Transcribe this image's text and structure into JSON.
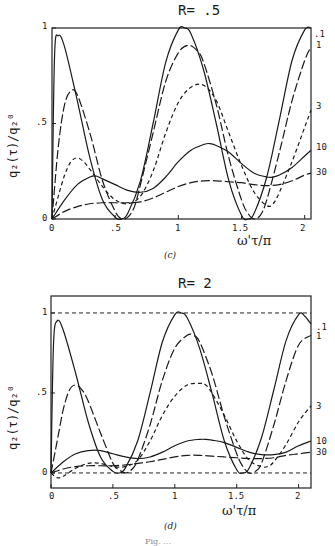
{
  "figure_caption_partial": "Fig. ...",
  "chart_data": [
    {
      "type": "line",
      "panel_label": "(c)",
      "title": "R= .5",
      "xlabel": "ω'τ/π",
      "ylabel": "q₂(τ)/q₂⁰",
      "xlim": [
        0,
        2.05
      ],
      "ylim": [
        0,
        1
      ],
      "xticks": [
        "0",
        ".5",
        "1",
        "1.5",
        "2"
      ],
      "yticks": [
        "0",
        ".5",
        "1"
      ],
      "grid": false,
      "legend_position": "right-edge labels",
      "reference_lines": [],
      "series": [
        {
          "name": ".1",
          "style": "solid",
          "x": [
            0,
            0.02,
            0.05,
            0.1,
            0.2,
            0.3,
            0.4,
            0.5,
            0.55,
            0.6,
            0.7,
            0.8,
            0.9,
            1.0,
            1.05,
            1.1,
            1.2,
            1.3,
            1.4,
            1.5,
            1.55,
            1.6,
            1.7,
            1.8,
            1.9,
            2.0,
            2.05
          ],
          "y": [
            0,
            0.85,
            0.96,
            0.9,
            0.62,
            0.32,
            0.1,
            0.01,
            0.0,
            0.03,
            0.2,
            0.5,
            0.82,
            0.99,
            1.0,
            0.97,
            0.78,
            0.5,
            0.2,
            0.02,
            0.0,
            0.03,
            0.22,
            0.52,
            0.83,
            0.99,
            1.0
          ]
        },
        {
          "name": "1",
          "style": "long-dash",
          "x": [
            0,
            0.05,
            0.1,
            0.15,
            0.2,
            0.3,
            0.4,
            0.5,
            0.55,
            0.6,
            0.65,
            0.7,
            0.8,
            0.9,
            1.0,
            1.08,
            1.15,
            1.2,
            1.3,
            1.4,
            1.5,
            1.55,
            1.6,
            1.65,
            1.7,
            1.8,
            1.9,
            2.0,
            2.05
          ],
          "y": [
            0,
            0.38,
            0.6,
            0.67,
            0.65,
            0.45,
            0.2,
            0.04,
            0.0,
            0.01,
            0.06,
            0.18,
            0.45,
            0.72,
            0.87,
            0.91,
            0.88,
            0.82,
            0.6,
            0.32,
            0.1,
            0.03,
            0.0,
            0.02,
            0.1,
            0.35,
            0.62,
            0.83,
            0.9
          ]
        },
        {
          "name": "3",
          "style": "short-dash",
          "x": [
            0,
            0.05,
            0.1,
            0.15,
            0.2,
            0.25,
            0.3,
            0.4,
            0.5,
            0.6,
            0.7,
            0.8,
            0.9,
            1.0,
            1.1,
            1.2,
            1.3,
            1.4,
            1.5,
            1.6,
            1.7,
            1.75,
            1.8,
            1.9,
            2.0,
            2.05
          ],
          "y": [
            0,
            0.12,
            0.23,
            0.3,
            0.32,
            0.3,
            0.26,
            0.17,
            0.1,
            0.08,
            0.12,
            0.25,
            0.45,
            0.61,
            0.69,
            0.7,
            0.62,
            0.45,
            0.28,
            0.14,
            0.07,
            0.08,
            0.14,
            0.3,
            0.48,
            0.57
          ]
        },
        {
          "name": "10",
          "style": "solid",
          "x": [
            0,
            0.1,
            0.2,
            0.3,
            0.35,
            0.4,
            0.5,
            0.6,
            0.7,
            0.8,
            0.9,
            1.0,
            1.1,
            1.2,
            1.25,
            1.3,
            1.4,
            1.5,
            1.6,
            1.7,
            1.75,
            1.8,
            1.9,
            2.0,
            2.05
          ],
          "y": [
            0,
            0.1,
            0.18,
            0.22,
            0.225,
            0.21,
            0.18,
            0.15,
            0.14,
            0.16,
            0.22,
            0.3,
            0.36,
            0.39,
            0.395,
            0.385,
            0.35,
            0.29,
            0.24,
            0.22,
            0.22,
            0.23,
            0.27,
            0.33,
            0.36
          ]
        },
        {
          "name": "30",
          "style": "long-dash",
          "x": [
            0,
            0.1,
            0.2,
            0.3,
            0.4,
            0.5,
            0.6,
            0.7,
            0.8,
            0.9,
            1.0,
            1.1,
            1.2,
            1.3,
            1.4,
            1.5,
            1.6,
            1.7,
            1.8,
            1.9,
            2.0,
            2.05
          ],
          "y": [
            0,
            0.04,
            0.065,
            0.08,
            0.085,
            0.085,
            0.085,
            0.09,
            0.11,
            0.14,
            0.17,
            0.19,
            0.2,
            0.2,
            0.195,
            0.19,
            0.18,
            0.175,
            0.18,
            0.2,
            0.23,
            0.24
          ]
        }
      ]
    },
    {
      "type": "line",
      "panel_label": "(d)",
      "title": "R= 2",
      "xlabel": "ω'τ/π",
      "ylabel": "q₂(τ)/q₂⁰",
      "xlim": [
        0,
        2.1
      ],
      "ylim": [
        -0.094,
        1.106
      ],
      "xticks": [
        "0",
        ".5",
        "1",
        "1.5",
        "2"
      ],
      "yticks": [
        "0",
        ".5",
        "1"
      ],
      "grid": false,
      "legend_position": "right-edge labels",
      "reference_lines": [
        {
          "y": 1,
          "style": "short-dash"
        },
        {
          "y": 0,
          "style": "short-dash"
        }
      ],
      "series": [
        {
          "name": ".1",
          "style": "solid",
          "x": [
            0,
            0.02,
            0.05,
            0.1,
            0.2,
            0.3,
            0.4,
            0.5,
            0.55,
            0.6,
            0.7,
            0.8,
            0.9,
            1.0,
            1.05,
            1.1,
            1.2,
            1.3,
            1.4,
            1.5,
            1.55,
            1.6,
            1.7,
            1.8,
            1.9,
            2.0,
            2.05,
            2.1
          ],
          "y": [
            0,
            0.8,
            0.95,
            0.89,
            0.62,
            0.32,
            0.1,
            0.01,
            0.0,
            0.03,
            0.2,
            0.5,
            0.82,
            0.99,
            1.0,
            0.97,
            0.78,
            0.5,
            0.2,
            0.02,
            0.0,
            0.03,
            0.22,
            0.52,
            0.83,
            0.99,
            0.98,
            0.93
          ]
        },
        {
          "name": "1",
          "style": "long-dash",
          "x": [
            0,
            0.05,
            0.1,
            0.15,
            0.2,
            0.25,
            0.3,
            0.4,
            0.5,
            0.55,
            0.6,
            0.65,
            0.7,
            0.8,
            0.9,
            1.0,
            1.1,
            1.15,
            1.2,
            1.3,
            1.4,
            1.5,
            1.55,
            1.6,
            1.65,
            1.7,
            1.8,
            1.9,
            2.0,
            2.1
          ],
          "y": [
            0,
            0.2,
            0.4,
            0.52,
            0.55,
            0.52,
            0.45,
            0.25,
            0.06,
            0.02,
            0.0,
            0.02,
            0.08,
            0.3,
            0.58,
            0.78,
            0.86,
            0.86,
            0.82,
            0.62,
            0.35,
            0.12,
            0.04,
            0.0,
            0.01,
            0.06,
            0.3,
            0.58,
            0.8,
            0.86
          ]
        },
        {
          "name": "3",
          "style": "short-dash",
          "x": [
            0,
            0.05,
            0.1,
            0.2,
            0.3,
            0.4,
            0.5,
            0.6,
            0.7,
            0.8,
            0.9,
            1.0,
            1.1,
            1.2,
            1.25,
            1.3,
            1.4,
            1.5,
            1.6,
            1.7,
            1.75,
            1.8,
            1.9,
            2.0,
            2.1
          ],
          "y": [
            0,
            -0.03,
            -0.02,
            0.03,
            0.06,
            0.06,
            0.04,
            0.04,
            0.08,
            0.2,
            0.36,
            0.48,
            0.55,
            0.56,
            0.55,
            0.5,
            0.36,
            0.2,
            0.08,
            0.04,
            0.04,
            0.07,
            0.18,
            0.32,
            0.42
          ]
        },
        {
          "name": "10",
          "style": "solid",
          "x": [
            0,
            0.1,
            0.2,
            0.3,
            0.4,
            0.5,
            0.6,
            0.7,
            0.8,
            0.9,
            1.0,
            1.1,
            1.2,
            1.25,
            1.3,
            1.4,
            1.5,
            1.6,
            1.7,
            1.8,
            1.9,
            2.0,
            2.1
          ],
          "y": [
            0,
            0.07,
            0.12,
            0.14,
            0.14,
            0.12,
            0.1,
            0.09,
            0.1,
            0.13,
            0.17,
            0.2,
            0.21,
            0.21,
            0.205,
            0.19,
            0.16,
            0.13,
            0.115,
            0.115,
            0.13,
            0.17,
            0.2
          ]
        },
        {
          "name": "30",
          "style": "long-dash",
          "x": [
            0,
            0.1,
            0.2,
            0.3,
            0.4,
            0.5,
            0.6,
            0.7,
            0.8,
            0.9,
            1.0,
            1.1,
            1.2,
            1.3,
            1.4,
            1.5,
            1.6,
            1.7,
            1.8,
            1.9,
            2.0,
            2.1
          ],
          "y": [
            0,
            0.025,
            0.04,
            0.045,
            0.045,
            0.045,
            0.05,
            0.06,
            0.07,
            0.085,
            0.1,
            0.11,
            0.11,
            0.105,
            0.1,
            0.095,
            0.09,
            0.09,
            0.095,
            0.11,
            0.12,
            0.13
          ]
        }
      ]
    }
  ]
}
